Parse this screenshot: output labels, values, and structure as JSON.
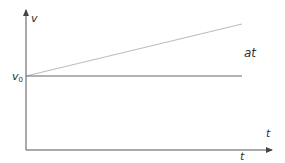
{
  "diagram": {
    "type": "velocity-time graph",
    "axes": {
      "y_label": "v",
      "x_label": "t"
    },
    "labels": {
      "v0_main": "v",
      "v0_sub": "0",
      "increment": "at",
      "t_upper": "t",
      "t_lower": "t"
    },
    "lines": [
      {
        "name": "velocity-line",
        "from": [
          26,
          76
        ],
        "to": [
          242,
          24
        ],
        "color": "#bdbdbd"
      },
      {
        "name": "initial-velocity-line",
        "from": [
          26,
          76
        ],
        "to": [
          242,
          76
        ],
        "color": "#666666"
      }
    ],
    "colors": {
      "axis": "#555555",
      "text": "#333333"
    }
  }
}
